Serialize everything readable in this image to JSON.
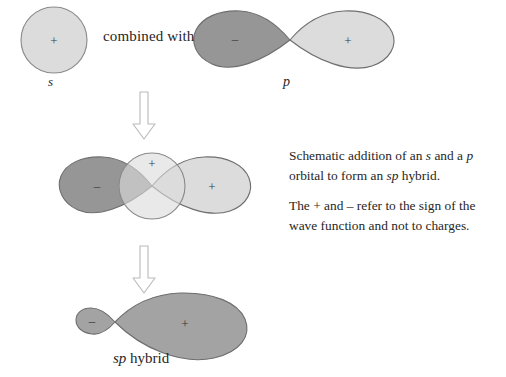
{
  "figure": {
    "title": "Schematic addition of an s and a p orbital to form an sp hybrid",
    "background_color": "#ffffff"
  },
  "labels": {
    "combined_with": "combined with",
    "s_caption": "s",
    "p_caption": "p",
    "sp_hybrid_caption_italic": "sp",
    "sp_hybrid_caption_rest": " hybrid"
  },
  "paragraphs": {
    "description": {
      "part1": "Schematic addition of an ",
      "italic1": "s",
      "part2": " and a ",
      "italic2": "p",
      "part3": " orbital to form an ",
      "italic3": "sp",
      "part4": " hybrid."
    },
    "note": {
      "text": "The + and – refer to the sign of the wave function and not to charges."
    }
  },
  "orbitals": {
    "s_orbital": {
      "name": "s orbital",
      "shape": "circle",
      "sign": "+",
      "fill": "#dcdcdc",
      "stroke": "#8a8a8a",
      "cx": 54,
      "cy": 40,
      "r": 33
    },
    "p_orbital": {
      "name": "p orbital",
      "shape": "two-lobe",
      "left_lobe": {
        "sign": "–",
        "fill": "#969696",
        "stroke": "#6e6e6e"
      },
      "right_lobe": {
        "sign": "+",
        "fill": "#dcdcdc",
        "stroke": "#6e6e6e"
      },
      "node_x": 290,
      "node_y": 40
    },
    "combined_orbital": {
      "name": "s plus p overlap",
      "s_circle": {
        "sign": "+",
        "fill": "#dcdcdc",
        "stroke": "#8a8a8a",
        "cx": 152,
        "cy": 186,
        "r": 33
      },
      "left_lobe": {
        "sign": "–",
        "fill": "#969696",
        "stroke": "#6e6e6e"
      },
      "right_lobe": {
        "sign": "+",
        "fill": "#dcdcdc",
        "stroke": "#6e6e6e"
      },
      "node_x": 152,
      "node_y": 186
    },
    "sp_hybrid": {
      "name": "sp hybrid orbital",
      "small_lobe": {
        "sign": "–",
        "fill": "#a3a3a3",
        "stroke": "#6e6e6e"
      },
      "large_lobe": {
        "sign": "+",
        "fill": "#a3a3a3",
        "stroke": "#6e6e6e"
      },
      "node_x": 115,
      "node_y": 322
    }
  },
  "arrows": [
    {
      "name": "arrow-s-p-to-overlap",
      "direction": "down",
      "x": 144,
      "y_top": 92,
      "y_bottom": 138,
      "stroke": "#b5b5b5"
    },
    {
      "name": "arrow-overlap-to-hybrid",
      "direction": "down",
      "x": 144,
      "y_top": 246,
      "y_bottom": 292,
      "stroke": "#b5b5b5"
    }
  ],
  "signs": {
    "plus": "+",
    "minus": "–"
  },
  "colors": {
    "light_gray": "#dcdcdc",
    "dark_gray": "#969696",
    "mid_gray": "#a3a3a3",
    "outline": "#6e6e6e",
    "arrow": "#b5b5b5",
    "text": "#262626"
  }
}
